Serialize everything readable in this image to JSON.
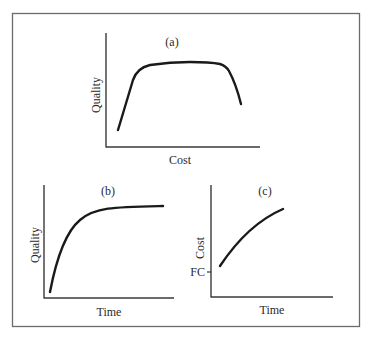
{
  "figure": {
    "panels": [
      {
        "id": "a",
        "label": "(a)",
        "xlabel": "Cost",
        "ylabel": "Quality",
        "description": "Quality rises steeply with cost, plateaus, then falls at high cost"
      },
      {
        "id": "b",
        "label": "(b)",
        "xlabel": "Time",
        "ylabel": "Quality",
        "description": "Quality rises rapidly over time then saturates"
      },
      {
        "id": "c",
        "label": "(c)",
        "xlabel": "Time",
        "ylabel": "Cost",
        "y_tick": "FC",
        "description": "Cost starts above fixed cost FC and increases concavely over time"
      }
    ],
    "colors": {
      "line": "#1a1a1a",
      "axis": "#3a3a3a",
      "border": "#6b6b6b",
      "background": "#ffffff"
    }
  }
}
